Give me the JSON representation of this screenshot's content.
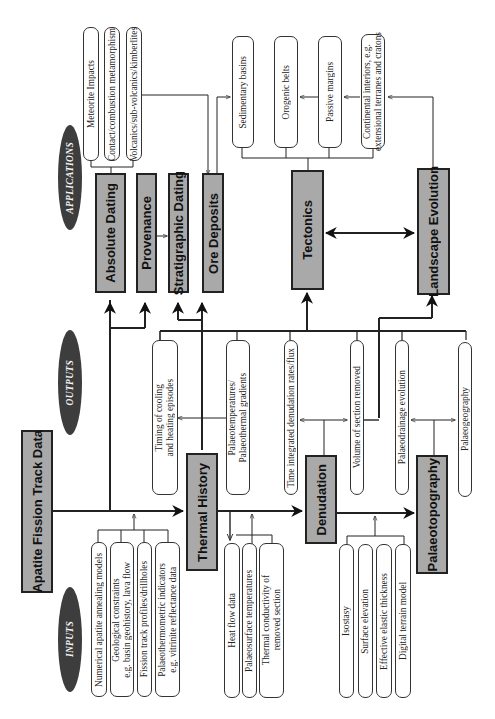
{
  "diagram": {
    "orientation": "rotated 90 degrees counter-clockwise (text reads bottom-to-top)",
    "colors": {
      "process_box": "#a9a9a9",
      "category_oval": "#3d3d3d",
      "item_box": "#ffffff",
      "lines": "#222222"
    },
    "categories": {
      "inputs": "INPUTS",
      "outputs": "OUTPUTS",
      "applications": "APPLICATIONS"
    },
    "source": {
      "title": "Apatite Fission Track Data"
    },
    "processes": {
      "thermal_history": "Thermal History",
      "denudation": "Denudation",
      "palaeotopography": "Palaeotopography"
    },
    "inputs": {
      "source_inputs": [
        "Numerical apatite annealing models",
        "Geological constraints e.g. basin geohistory, lava flow",
        "Fission track profiles/drillholes",
        "Palaeothermometric indicators e.g. vitrinite reflectance data"
      ],
      "source_inputs_lines": [
        [
          "Numerical apatite annealing models"
        ],
        [
          "Geological constraints",
          "e.g. basin geohistory, lava flow"
        ],
        [
          "Fission track profiles/drillholes"
        ],
        [
          "Palaeothermometric indicators",
          "e.g. vitrinite reflectance data"
        ]
      ],
      "thermal_inputs": [
        "Heat flow data",
        "Palaeosurface temperatures",
        "Thermal conductivity of removed section"
      ],
      "thermal_inputs_lines": [
        [
          "Heat flow data"
        ],
        [
          "Palaeosurface temperatures"
        ],
        [
          "Thermal conductivity of",
          "removed section"
        ]
      ],
      "denudation_inputs": [
        "Isostasy",
        "Surface elevation",
        "Effective elastic thickness",
        "Digital terrain model"
      ]
    },
    "outputs": {
      "thermal_outputs_lines": [
        [
          "Timing of cooling",
          "and heating episodes"
        ],
        [
          "Palaeotemperatures/",
          "Palaeothermal gradients"
        ]
      ],
      "denudation_outputs": [
        "Time integrated denudation rates/flux",
        "Volume of section removed"
      ],
      "palaeotopography_outputs": [
        "Palaeodrainage evolution",
        "Palaeogeography"
      ]
    },
    "applications": {
      "boxes": [
        "Absolute Dating",
        "Provenance",
        "Stratigraphic Dating",
        "Ore Deposits",
        "Tectonics",
        "Landscape Evolution"
      ],
      "dating_subapps": [
        "Meteorite Impacts",
        "Contact/combustion metamorphism",
        "Volcanics/sub-volcanics/kimberlites"
      ],
      "tectonic_settings_lines": [
        [
          "Sedimentary basins"
        ],
        [
          "Orogenic belts"
        ],
        [
          "Passive margins"
        ],
        [
          "Continental interiors, e.g.",
          "extensional terranes and cratons"
        ]
      ]
    }
  }
}
